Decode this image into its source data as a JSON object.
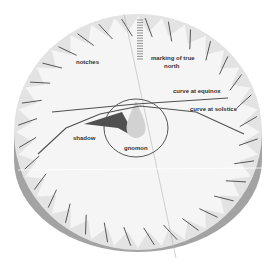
{
  "diagram": {
    "labels": {
      "notches": "notches",
      "north_line1": "marking of true",
      "north_line2": "north",
      "equinox": "curve at equinox",
      "solstice": "curve at solstice",
      "shadow": "shadow",
      "gnomon": "gnomon"
    },
    "colors": {
      "face": "#f4f4f4",
      "notch_fill": "#dcdcdc",
      "rim": "#a8a8a8",
      "rim_dark": "#9a9a9a",
      "line": "#555555",
      "shadow": "#555555",
      "gnomon": "#cfcfcf"
    },
    "notch_count": 32
  }
}
